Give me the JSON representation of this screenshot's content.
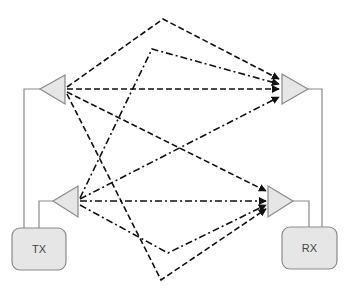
{
  "diagram": {
    "colors": {
      "background": "#ffffff",
      "node_fill": "#e6e6e6",
      "node_stroke": "#8a8a8a",
      "wire": "#8a8a8a",
      "path": "#111111"
    },
    "boxes": [
      {
        "id": "tx",
        "label": "TX",
        "x": 12,
        "y": 228,
        "w": 54,
        "h": 42
      },
      {
        "id": "rx",
        "label": "RX",
        "x": 282,
        "y": 227,
        "w": 55,
        "h": 42
      }
    ],
    "antennas": [
      {
        "id": "tx-ant-1",
        "dir": "left",
        "tip": [
          40,
          89
        ],
        "base_x": 65,
        "base_y1": 75,
        "base_y2": 104
      },
      {
        "id": "tx-ant-2",
        "dir": "left",
        "tip": [
          53,
          201
        ],
        "base_x": 78,
        "base_y1": 186,
        "base_y2": 217
      },
      {
        "id": "rx-ant-1",
        "dir": "right",
        "tip": [
          308,
          89
        ],
        "base_x": 282,
        "base_y1": 74,
        "base_y2": 104
      },
      {
        "id": "rx-ant-2",
        "dir": "right",
        "tip": [
          293,
          201
        ],
        "base_x": 268,
        "base_y1": 186,
        "base_y2": 217
      }
    ],
    "wires": [
      {
        "from": "tx-ant-1",
        "points": [
          [
            40,
            89
          ],
          [
            24,
            89
          ],
          [
            24,
            228
          ]
        ]
      },
      {
        "from": "tx-ant-2",
        "points": [
          [
            53,
            201
          ],
          [
            39,
            201
          ],
          [
            39,
            228
          ]
        ]
      },
      {
        "from": "rx-ant-1",
        "points": [
          [
            308,
            89
          ],
          [
            322,
            89
          ],
          [
            322,
            227
          ]
        ]
      },
      {
        "from": "rx-ant-2",
        "points": [
          [
            293,
            201
          ],
          [
            309,
            201
          ],
          [
            309,
            227
          ]
        ]
      }
    ],
    "paths": [
      {
        "from": "tx-ant-1",
        "to": "rx-ant-1",
        "style": "dashed",
        "type": "reflected-top",
        "points": [
          [
            67,
            87
          ],
          [
            163,
            19
          ],
          [
            279,
            79
          ]
        ]
      },
      {
        "from": "tx-ant-1",
        "to": "rx-ant-1",
        "style": "dashed",
        "type": "direct",
        "points": [
          [
            67,
            89
          ],
          [
            279,
            89
          ]
        ]
      },
      {
        "from": "tx-ant-1",
        "to": "rx-ant-2",
        "style": "dashed",
        "type": "direct",
        "points": [
          [
            67,
            92
          ],
          [
            266,
            191
          ]
        ]
      },
      {
        "from": "tx-ant-1",
        "to": "rx-ant-2",
        "style": "dashed",
        "type": "reflected-bottom",
        "points": [
          [
            67,
            94
          ],
          [
            161,
            280
          ],
          [
            266,
            209
          ]
        ]
      },
      {
        "from": "tx-ant-2",
        "to": "rx-ant-1",
        "style": "dash-dot",
        "type": "reflected-top",
        "points": [
          [
            80,
            198
          ],
          [
            152,
            49
          ],
          [
            279,
            84
          ]
        ]
      },
      {
        "from": "tx-ant-2",
        "to": "rx-ant-1",
        "style": "dash-dot",
        "type": "direct",
        "points": [
          [
            80,
            199
          ],
          [
            279,
            97
          ]
        ]
      },
      {
        "from": "tx-ant-2",
        "to": "rx-ant-2",
        "style": "dash-dot",
        "type": "direct",
        "points": [
          [
            80,
            201
          ],
          [
            266,
            201
          ]
        ]
      },
      {
        "from": "tx-ant-2",
        "to": "rx-ant-2",
        "style": "dash-dot",
        "type": "reflected-bottom",
        "points": [
          [
            80,
            205
          ],
          [
            168,
            253
          ],
          [
            266,
            205
          ]
        ]
      }
    ]
  }
}
